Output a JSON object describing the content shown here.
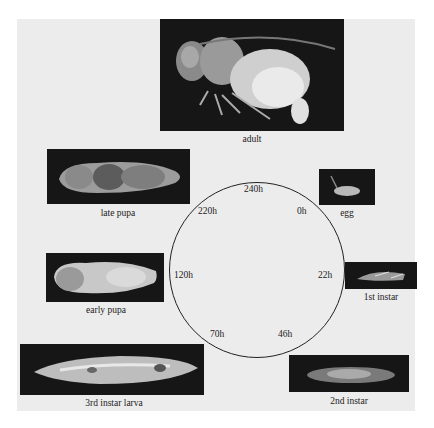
{
  "figure": {
    "background": "#ececec",
    "photo_background": "#161616",
    "stages": [
      {
        "id": "adult",
        "caption": "adult"
      },
      {
        "id": "egg",
        "caption": "egg"
      },
      {
        "id": "1st-instar",
        "caption": "1st instar"
      },
      {
        "id": "2nd-instar",
        "caption": "2nd instar"
      },
      {
        "id": "3rd-instar-larva",
        "caption": "3rd instar larva"
      },
      {
        "id": "early-pupa",
        "caption": "early pupa"
      },
      {
        "id": "late-pupa",
        "caption": "late pupa"
      }
    ],
    "cycle": {
      "labels": [
        {
          "position": "top",
          "text": "240h"
        },
        {
          "position": "upper-right",
          "text": "0h"
        },
        {
          "position": "right",
          "text": "22h"
        },
        {
          "position": "lower-right",
          "text": "46h"
        },
        {
          "position": "lower-left",
          "text": "70h"
        },
        {
          "position": "left",
          "text": "120h"
        },
        {
          "position": "upper-left",
          "text": "220h"
        }
      ]
    }
  }
}
